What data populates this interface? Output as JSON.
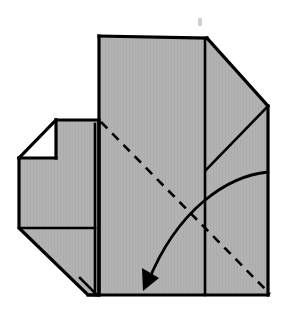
{
  "figure": {
    "canvas": {
      "width": 286,
      "height": 311
    },
    "background_color": "#ffffff"
  },
  "style": {
    "paper_fill": "#b2b2b2",
    "paper_fill_shadow": "#a8a8a8",
    "outline_color": "#000000",
    "outline_width": 3.2,
    "inner_line_width": 2.6,
    "crease_color": "#000000",
    "crease_width": 2.6,
    "crease_dash": "9 7",
    "arrow_color": "#000000",
    "arrow_width": 2.8,
    "speck_color": "#cfcfcf"
  },
  "shapes": {
    "main_body": {
      "name": "main-paper-body",
      "points": "99,36 207,38 268,106 268,295 88,295 99,295"
    },
    "left_flap": {
      "name": "left-flap",
      "points": "56,120 99,120 99,295 88,295 19,228 19,158 56,158"
    },
    "left_flap_outline": {
      "name": "left-flap-outline",
      "points": "56,120 99,120 99,295 88,295 19,228 19,158"
    }
  },
  "lines": {
    "top_right_diagonal": {
      "name": "top-right-bevel-edge",
      "points": "207,38 268,106"
    },
    "inner_right_diagonal": {
      "name": "inner-right-crease",
      "points": "268,106 206,170"
    },
    "center_vertical": {
      "name": "center-vertical-crease",
      "points": "205,38 205,295"
    },
    "flap_right_vertical": {
      "name": "flap-right-edge",
      "points": "95,124 95,295"
    },
    "flap_notch_diagonal": {
      "name": "notch-diagonal-edge",
      "points": "56,120 19,158"
    },
    "flap_notch_horizontal": {
      "name": "notch-horizontal-edge",
      "points": "19,158 56,158"
    },
    "flap_notch_vertical": {
      "name": "notch-vertical-edge",
      "points": "56,120 56,158"
    },
    "flap_mid_horizontal": {
      "name": "flap-horizontal-crease",
      "points": "19,228 95,228"
    },
    "flap_bottom_diagonal": {
      "name": "flap-bottom-bevel-edge",
      "points": "19,228 88,295"
    },
    "flap_corner_diagonal": {
      "name": "flap-corner-crease",
      "points": "80,278 97,295"
    },
    "body_left_vertical": {
      "name": "body-left-edge",
      "points": "99,36 99,295"
    },
    "body_right_vertical": {
      "name": "body-right-edge",
      "points": "268,106 268,295"
    },
    "body_top_horizontal": {
      "name": "body-top-edge",
      "points": "99,36 207,38"
    },
    "body_bottom_horizontal": {
      "name": "body-bottom-edge",
      "points": "88,295 268,295"
    }
  },
  "crease": {
    "name": "valley-fold-dashed-crease",
    "label": "valley fold",
    "path": "M 101 122 L 270 294"
  },
  "arrow": {
    "name": "fold-direction-arrow",
    "label": "fold this edge down and to the left",
    "path": "M 268 172 C 228 176, 178 208, 148 282",
    "head": "143,291 142,268 159,278"
  },
  "marks": {
    "speck": {
      "name": "stray-speck-mark",
      "cx": 200,
      "cy": 22,
      "rx": 2.2,
      "ry": 4.5
    }
  }
}
